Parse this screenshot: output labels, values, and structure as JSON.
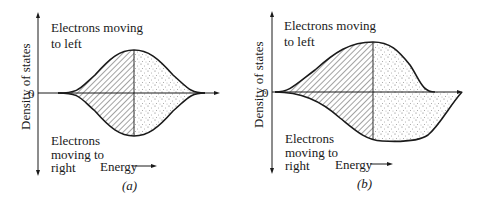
{
  "figure": {
    "panels": [
      {
        "id": "a",
        "caption": "(a)",
        "y_axis_label": "Density of states",
        "zero_label": "0",
        "upper_label_line1": "Electrons moving",
        "upper_label_line2": "to left",
        "lower_label_line1": "Electrons",
        "lower_label_line2": "moving to",
        "lower_label_line3": "right",
        "x_axis_label": "Energy",
        "description": "Symmetric density of states for left- and right-moving electrons; occupied states (hatched) up to Fermi level, unoccupied (dotted) above"
      },
      {
        "id": "b",
        "caption": "(b)",
        "y_axis_label": "Density of states",
        "zero_label": "0",
        "upper_label_line1": "Electrons moving",
        "upper_label_line2": "to left",
        "lower_label_line1": "Electrons",
        "lower_label_line2": "moving to",
        "lower_label_line3": "right",
        "x_axis_label": "Energy",
        "description": "Shifted distributions under applied field: left-moving band shifted to lower energy, right-moving band shifted to higher energy"
      }
    ],
    "legend": {
      "hatched": "occupied states",
      "dotted": "unoccupied states"
    },
    "colors": {
      "line": "#1a1a1a",
      "hatch": "#333333",
      "dots": "#555555",
      "background": "#ffffff"
    }
  }
}
